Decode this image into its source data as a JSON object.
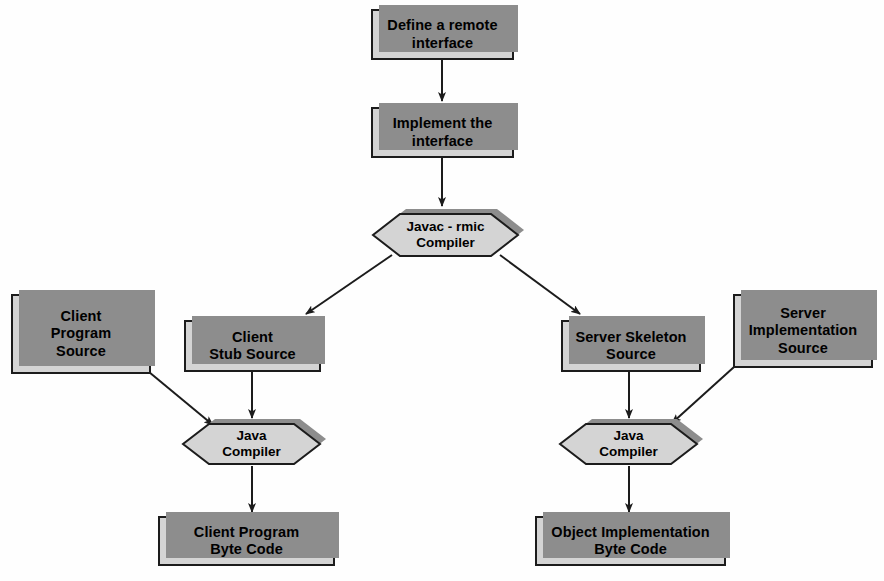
{
  "diagram": {
    "type": "flowchart",
    "background_color": "#fefefe",
    "node_fill_color": "#d4d4d4",
    "node_border_color": "#1c1c1c",
    "node_shadow_color": "#8d8d8d",
    "edge_color": "#1c1c1c"
  },
  "nodes": {
    "define_remote_interface": {
      "label": "Define a remote\ninterface",
      "shape": "rectangle",
      "x": 371,
      "y": 9,
      "w": 143,
      "h": 51,
      "font_size": 14.5
    },
    "implement_interface": {
      "label": "Implement the\ninterface",
      "shape": "rectangle",
      "x": 371,
      "y": 107,
      "w": 143,
      "h": 51,
      "font_size": 14.5
    },
    "javac_rmic_compiler": {
      "label": "Javac - rmic\nCompiler",
      "shape": "hexagon",
      "x": 372,
      "y": 211,
      "w": 147,
      "h": 48,
      "font_size": 13.5
    },
    "client_program_source": {
      "label": "Client\nProgram\nSource",
      "shape": "rectangle",
      "x": 11,
      "y": 294,
      "w": 140,
      "h": 80,
      "font_size": 14.5
    },
    "client_stub_source": {
      "label": "Client\nStub Source",
      "shape": "rectangle",
      "x": 184,
      "y": 320,
      "w": 137,
      "h": 52,
      "font_size": 14.5
    },
    "server_skeleton_source": {
      "label": "Server Skeleton\nSource",
      "shape": "rectangle",
      "x": 561,
      "y": 320,
      "w": 140,
      "h": 52,
      "font_size": 14.5
    },
    "server_implementation_source": {
      "label": "Server\nImplementation\nSource",
      "shape": "rectangle",
      "x": 733,
      "y": 294,
      "w": 140,
      "h": 74,
      "font_size": 14.5
    },
    "java_compiler_left": {
      "label": "Java\nCompiler",
      "shape": "hexagon",
      "x": 182,
      "y": 421,
      "w": 139,
      "h": 46,
      "font_size": 13.5
    },
    "java_compiler_right": {
      "label": "Java\nCompiler",
      "shape": "hexagon",
      "x": 559,
      "y": 421,
      "w": 139,
      "h": 46,
      "font_size": 13.5
    },
    "client_program_byte_code": {
      "label": "Client Program\nByte Code",
      "shape": "rectangle",
      "x": 158,
      "y": 516,
      "w": 177,
      "h": 50,
      "font_size": 14.5
    },
    "object_implementation_byte_code": {
      "label": "Object Implementation\nByte Code",
      "shape": "rectangle",
      "x": 535,
      "y": 516,
      "w": 191,
      "h": 50,
      "font_size": 14.5
    }
  },
  "edges": [
    {
      "id": "e1",
      "from": "define_remote_interface",
      "to": "implement_interface",
      "points": "442,60 442,101",
      "arrow": true
    },
    {
      "id": "e2",
      "from": "implement_interface",
      "to": "javac_rmic_compiler",
      "points": "442,158 442,206",
      "arrow": true
    },
    {
      "id": "e3",
      "from": "javac_rmic_compiler",
      "to": "client_stub_source",
      "points": "388,257 306,315",
      "arrow": true
    },
    {
      "id": "e4",
      "from": "javac_rmic_compiler",
      "to": "server_skeleton_source",
      "points": "503,257 578,315",
      "arrow": true
    },
    {
      "id": "e5",
      "from": "client_program_source",
      "to": "java_compiler_left",
      "points": "150,374 212,424",
      "arrow": true
    },
    {
      "id": "e6",
      "from": "client_stub_source",
      "to": "java_compiler_left",
      "points": "252,372 252,417",
      "arrow": true
    },
    {
      "id": "e7",
      "from": "server_skeleton_source",
      "to": "java_compiler_right",
      "points": "629,372 629,417",
      "arrow": true
    },
    {
      "id": "e8",
      "from": "server_implementation_source",
      "to": "java_compiler_right",
      "points": "733,368 673,422",
      "arrow": true
    },
    {
      "id": "e9",
      "from": "java_compiler_left",
      "to": "client_program_byte_code",
      "points": "252,467 252,512",
      "arrow": true
    },
    {
      "id": "e10",
      "from": "java_compiler_right",
      "to": "object_implementation_byte_code",
      "points": "629,467 629,512",
      "arrow": true
    }
  ]
}
